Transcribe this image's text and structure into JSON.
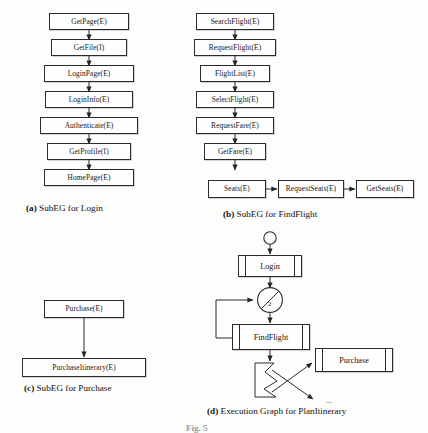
{
  "figure": {
    "number_partial": "Fig. 5",
    "background_color": "#fdfdfb",
    "line_color": "#2b2b2b"
  },
  "panels": {
    "a": {
      "caption_tag": "(a)",
      "caption_text": "SubEG for Login",
      "nodes": [
        {
          "id": "getpage",
          "label": "GetPage(E)"
        },
        {
          "id": "getfile",
          "label": "GetFile(I)"
        },
        {
          "id": "loginpage",
          "label": "LoginPage(E)"
        },
        {
          "id": "logininfo",
          "label": "LoginInfo(E)"
        },
        {
          "id": "authenticate",
          "label": "Authenticate(E)"
        },
        {
          "id": "getprofile",
          "label": "GetProfile(I)"
        },
        {
          "id": "homepage",
          "label": "HomePage(E)"
        }
      ]
    },
    "b": {
      "caption_tag": "(b)",
      "caption_text": "SubEG for FindFlight",
      "nodes": [
        {
          "id": "searchflight",
          "label": "SearchFlight(E)"
        },
        {
          "id": "requestflight",
          "label": "RequestFlight(E)"
        },
        {
          "id": "flightlist",
          "label": "FlightList(E)"
        },
        {
          "id": "selectflight",
          "label": "SelectFlight(E)"
        },
        {
          "id": "requestfare",
          "label": "RequestFare(E)"
        },
        {
          "id": "getfare",
          "label": "GetFare(E)"
        },
        {
          "id": "seats",
          "label": "Seats(E)"
        },
        {
          "id": "requestseats",
          "label": "RequestSeats(E)"
        },
        {
          "id": "getseats",
          "label": "GetSeats(E)"
        }
      ]
    },
    "c": {
      "caption_tag": "(c)",
      "caption_text": "SubEG for Purchase",
      "nodes": [
        {
          "id": "purchase",
          "label": "Purchase(E)"
        },
        {
          "id": "purchaseitinerary",
          "label": "PurchaseItinerary(E)"
        }
      ]
    },
    "d": {
      "caption_tag": "(d)",
      "caption_text": "Execution Graph for PlanItinerary",
      "start_node": "initial-state-circle",
      "merge_label": "2",
      "ellipsis": "...",
      "nodes": [
        {
          "id": "login",
          "label": "Login"
        },
        {
          "id": "findflight",
          "label": "FindFlight"
        },
        {
          "id": "purchase",
          "label": "Purchase"
        }
      ]
    }
  }
}
